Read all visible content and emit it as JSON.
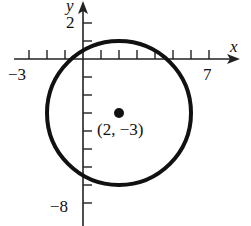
{
  "chart_data": {
    "type": "scatter",
    "title": "",
    "xlabel": "x",
    "ylabel": "y",
    "x_tick_labels": [
      {
        "value": -3,
        "label": "−3"
      },
      {
        "value": 7,
        "label": "7"
      }
    ],
    "y_tick_labels": [
      {
        "value": 2,
        "label": "2"
      },
      {
        "value": -8,
        "label": "−8"
      }
    ],
    "x_ticks": [
      -3,
      -2,
      -1,
      1,
      2,
      3,
      4,
      5,
      6,
      7
    ],
    "y_ticks": [
      2,
      1,
      -1,
      -2,
      -3,
      -4,
      -5,
      -6,
      -7,
      -8
    ],
    "xlim": [
      -4,
      8.5
    ],
    "ylim": [
      -9,
      3
    ],
    "grid": false,
    "series": [
      {
        "name": "circle",
        "shape": "circle",
        "center": [
          2,
          -3
        ],
        "radius": 4
      },
      {
        "name": "center point",
        "shape": "point",
        "x": [
          2
        ],
        "y": [
          -3
        ]
      }
    ],
    "annotations": [
      {
        "text": "(2, −3)",
        "x": 2,
        "y": -3
      }
    ]
  },
  "labels": {
    "x_axis": "x",
    "y_axis": "y",
    "x_min": "−3",
    "x_max": "7",
    "y_max": "2",
    "y_min": "−8",
    "center_label": "(2, −3)"
  }
}
